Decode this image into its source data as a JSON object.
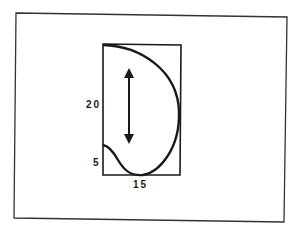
{
  "diagram": {
    "labels": {
      "height_total": "20",
      "height_lower": "5",
      "width": "15"
    },
    "colors": {
      "stroke": "#1a1a1a",
      "frame": "#333333",
      "background": "#ffffff"
    },
    "shapes": {
      "outer_frame": "rectangle",
      "inner_box": "rectangle",
      "outline": "D-shaped curve",
      "arrow": "vertical double-headed arrow"
    }
  }
}
